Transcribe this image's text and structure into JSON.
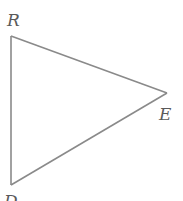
{
  "diagram": {
    "type": "triangle",
    "vertices": [
      {
        "name": "R",
        "x": 11,
        "y": 36,
        "label_x": 7,
        "label_y": 26
      },
      {
        "name": "E",
        "x": 167,
        "y": 93,
        "label_x": 159,
        "label_y": 120
      },
      {
        "name": "D",
        "x": 11,
        "y": 185,
        "label_x": 4,
        "label_y": 207
      }
    ],
    "edges": [
      [
        "R",
        "E"
      ],
      [
        "E",
        "D"
      ],
      [
        "D",
        "R"
      ]
    ],
    "colors": {
      "line": "#8a8a8a",
      "label": "#5a5a5a",
      "background": "#ffffff"
    }
  }
}
